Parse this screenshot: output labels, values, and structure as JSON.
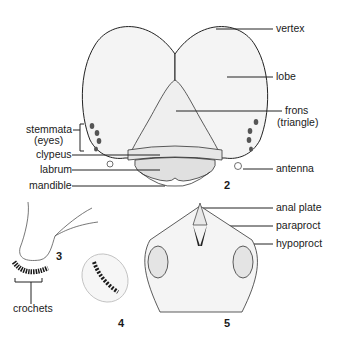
{
  "figure": {
    "labels": {
      "vertex": "vertex",
      "lobe": "lobe",
      "frons_1": "frons",
      "frons_2": "(triangle)",
      "stemmata_1": "stemmata",
      "stemmata_2": "(eyes)",
      "clypeus": "clypeus",
      "labrum": "labrum",
      "antenna": "antenna",
      "mandible": "mandible",
      "anal_plate": "anal plate",
      "paraproct": "paraproct",
      "hypoproct": "hypoproct",
      "crochets": "crochets"
    },
    "panel_numbers": {
      "head": "2",
      "proleg": "3",
      "crochet_detail": "4",
      "anal_region": "5"
    },
    "colors": {
      "line": "#222222",
      "shade": "#e9e9e9",
      "dark": "#1a1a1a"
    }
  }
}
